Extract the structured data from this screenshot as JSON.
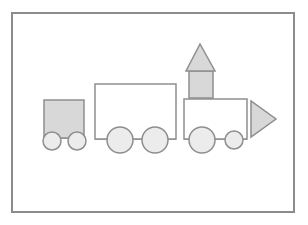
{
  "diagram": {
    "title": "",
    "colors": {
      "background": "#ffffff",
      "frame_stroke": "#8c8c8c",
      "shape_stroke": "#8e8e8e",
      "shaded_fill": "#d8d8d8",
      "wheel_fill": "#ececec",
      "plain_fill": "#ffffff"
    },
    "frame": {
      "x": 12,
      "y": 13,
      "width": 282,
      "height": 199
    },
    "cars": [
      {
        "name": "caboose",
        "body": {
          "shape": "square",
          "x": 44,
          "y": 100,
          "width": 40,
          "height": 38,
          "fill": "shaded"
        },
        "wheels": [
          {
            "cx": 52,
            "cy": 141,
            "r": 9
          },
          {
            "cx": 77,
            "cy": 141,
            "r": 9
          }
        ]
      },
      {
        "name": "boxcar",
        "body": {
          "shape": "rectangle",
          "x": 95,
          "y": 84,
          "width": 81,
          "height": 55,
          "fill": "plain"
        },
        "wheels": [
          {
            "cx": 120,
            "cy": 140,
            "r": 13
          },
          {
            "cx": 155,
            "cy": 140,
            "r": 13
          }
        ]
      },
      {
        "name": "engine",
        "body": {
          "shape": "rectangle",
          "x": 184,
          "y": 99,
          "width": 63,
          "height": 40,
          "fill": "plain"
        },
        "chimney": {
          "shape": "square",
          "x": 189,
          "y": 71,
          "width": 24,
          "height": 27,
          "fill": "shaded"
        },
        "chimney_roof": {
          "shape": "triangle",
          "points": "200,44 186,71 215,71",
          "fill": "shaded"
        },
        "front": {
          "shape": "triangle",
          "points": "251,101 251,137 276,119",
          "fill": "shaded"
        },
        "wheels": [
          {
            "cx": 202,
            "cy": 140,
            "r": 13
          },
          {
            "cx": 234,
            "cy": 140,
            "r": 9
          }
        ]
      }
    ]
  }
}
